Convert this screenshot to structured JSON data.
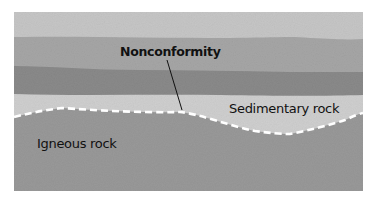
{
  "diagram": {
    "title": "Nonconformity",
    "labels": {
      "nonconformity": "Nonconformity",
      "sedimentary": "Sedimentary rock",
      "igneous": "Igneous rock"
    },
    "colors": {
      "top_layer": "#c6c6c6",
      "middle_layer": "#a3a3a3",
      "dark_layer": "#8a8a8a",
      "sedimentary_layer": "#d0d0d0",
      "igneous": "#999999",
      "boundary_line": "#ffffff",
      "leader_line": "#111111"
    }
  }
}
